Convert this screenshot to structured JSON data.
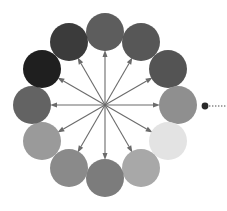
{
  "diagram": {
    "title": "Grayscale circle wheel with radial arrows",
    "type": "radial-wheel",
    "background_color": "#ffffff",
    "canvas": {
      "width": 227,
      "height": 211
    },
    "center": {
      "x": 105,
      "y": 105
    },
    "ring_radius": 73,
    "circle_radius": 19,
    "circle_count": 12,
    "arrow_count": 12,
    "arrow_color": "#6b6b6b",
    "arrow_length": 55,
    "arrow_line_width": 1.1,
    "arrowhead_length": 7,
    "arrowhead_width": 5
  },
  "circles": [
    {
      "name": "circle-12-oclock",
      "position_label": "top",
      "angle_deg": 90,
      "cx": 105,
      "cy": 32,
      "r": 19,
      "fill": "#5d5d5d"
    },
    {
      "name": "circle-1-oclock",
      "position_label": "upper-right",
      "angle_deg": 60,
      "cx": 141,
      "cy": 42,
      "r": 19,
      "fill": "#575757"
    },
    {
      "name": "circle-2-oclock",
      "position_label": "right-upper",
      "angle_deg": 30,
      "cx": 168,
      "cy": 69,
      "r": 19,
      "fill": "#545454"
    },
    {
      "name": "circle-3-oclock",
      "position_label": "right",
      "angle_deg": 0,
      "cx": 178,
      "cy": 105,
      "r": 19,
      "fill": "#8f8f8f"
    },
    {
      "name": "circle-4-oclock",
      "position_label": "right-lower",
      "angle_deg": -30,
      "cx": 168,
      "cy": 141,
      "r": 19,
      "fill": "#e3e3e3"
    },
    {
      "name": "circle-5-oclock",
      "position_label": "lower-right",
      "angle_deg": -60,
      "cx": 141,
      "cy": 168,
      "r": 19,
      "fill": "#a8a8a8"
    },
    {
      "name": "circle-6-oclock",
      "position_label": "bottom",
      "angle_deg": -90,
      "cx": 105,
      "cy": 178,
      "r": 19,
      "fill": "#7c7c7c"
    },
    {
      "name": "circle-7-oclock",
      "position_label": "lower-left",
      "angle_deg": -120,
      "cx": 69,
      "cy": 168,
      "r": 19,
      "fill": "#8a8a8a"
    },
    {
      "name": "circle-8-oclock",
      "position_label": "left-lower",
      "angle_deg": -150,
      "cx": 42,
      "cy": 141,
      "r": 19,
      "fill": "#9a9a9a"
    },
    {
      "name": "circle-9-oclock",
      "position_label": "left",
      "angle_deg": 180,
      "cx": 32,
      "cy": 105,
      "r": 19,
      "fill": "#636363"
    },
    {
      "name": "circle-10-oclock",
      "position_label": "upper-left",
      "angle_deg": 150,
      "cx": 42,
      "cy": 69,
      "r": 19,
      "fill": "#1f1f1f"
    },
    {
      "name": "circle-11-oclock",
      "position_label": "left-upper",
      "angle_deg": 120,
      "cx": 69,
      "cy": 42,
      "r": 19,
      "fill": "#3b3b3b"
    }
  ],
  "arrows": [
    {
      "name": "arrow-90",
      "angle_deg": 90
    },
    {
      "name": "arrow-60",
      "angle_deg": 60
    },
    {
      "name": "arrow-30",
      "angle_deg": 30
    },
    {
      "name": "arrow-0",
      "angle_deg": 0
    },
    {
      "name": "arrow-330",
      "angle_deg": -30
    },
    {
      "name": "arrow-300",
      "angle_deg": -60
    },
    {
      "name": "arrow-270",
      "angle_deg": -90
    },
    {
      "name": "arrow-240",
      "angle_deg": -120
    },
    {
      "name": "arrow-210",
      "angle_deg": -150
    },
    {
      "name": "arrow-180",
      "angle_deg": 180
    },
    {
      "name": "arrow-150",
      "angle_deg": 150
    },
    {
      "name": "arrow-120",
      "angle_deg": 120
    }
  ],
  "marker": {
    "name": "selection-dot",
    "cx": 205,
    "cy": 106,
    "r": 3.4,
    "fill": "#2a2a2a",
    "leader_line": {
      "name": "dotted-leader-line",
      "x1": 209,
      "y1": 106,
      "x2": 227,
      "y2": 106,
      "color": "#4a4a4a",
      "width": 1.2,
      "dash": "1.4 1.6"
    }
  }
}
